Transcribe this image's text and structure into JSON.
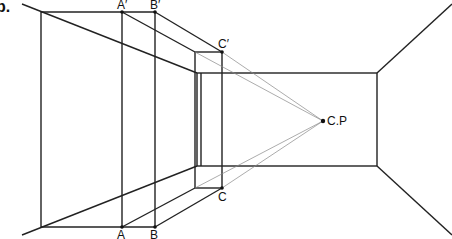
{
  "figure": {
    "marker": "b.",
    "labels": {
      "a_prime": "A′",
      "b_prime": "B′",
      "c_prime": "C′",
      "a": "A",
      "b": "B",
      "c": "C",
      "cp": "C.P"
    },
    "colors": {
      "line": "#222222",
      "projector": "#888888",
      "background": "#ffffff"
    }
  }
}
